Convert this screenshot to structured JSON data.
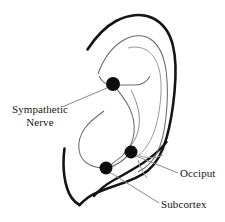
{
  "figure": {
    "type": "anatomical-diagram",
    "background_color": "#ffffff",
    "ink_color": "#151515",
    "inner_line_color": "#6a6a6a",
    "marker_color": "#0d0d0d",
    "leader_color": "#8a8a8a"
  },
  "labels": {
    "sympathetic": "Sympathetic Nerve",
    "sympathetic_line1": "Sympathetic",
    "sympathetic_line2": "Nerve",
    "occiput": "Occiput",
    "subcortex": "Subcortex"
  },
  "points": [
    {
      "name": "sympathetic-nerve",
      "label": "Sympathetic Nerve",
      "x": 113,
      "y": 84,
      "r": 7
    },
    {
      "name": "occiput",
      "label": "Occiput",
      "x": 131,
      "y": 152,
      "r": 6.5
    },
    {
      "name": "subcortex",
      "label": "Subcortex",
      "x": 106,
      "y": 168,
      "r": 6.5
    }
  ],
  "leaders": [
    {
      "name": "sympathetic-leader",
      "from_x": 107,
      "from_y": 88,
      "to_x": 62,
      "to_y": 107
    },
    {
      "name": "occiput-leader",
      "from_x": 136,
      "from_y": 156,
      "to_x": 178,
      "to_y": 173
    },
    {
      "name": "subcortex-leader",
      "from_x": 111,
      "from_y": 173,
      "to_x": 159,
      "to_y": 203
    }
  ]
}
